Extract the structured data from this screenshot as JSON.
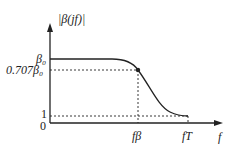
{
  "diagram": {
    "title": "",
    "y_axis_label": "|β(jf)|",
    "x_axis_label": "f",
    "y_ticks": [
      {
        "label": "β₀",
        "value": "beta_0"
      },
      {
        "label": "0.707β₀",
        "value": "0.707*beta_0"
      },
      {
        "label": "1",
        "value": 1
      },
      {
        "label": "0",
        "value": 0
      }
    ],
    "x_ticks": [
      {
        "label": "fβ",
        "value": "f_beta"
      },
      {
        "label": "fT",
        "value": "f_T"
      }
    ],
    "curve": "Low-pass magnitude response: flat at β₀, passes through 0.707β₀ at fβ (marked point), falls to 1 at fT",
    "colors": {
      "line": "#222222",
      "background": "#ffffff"
    }
  }
}
